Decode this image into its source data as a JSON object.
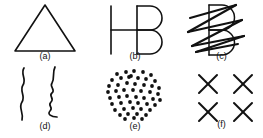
{
  "figure": {
    "background_color": "#ffffff",
    "ink_color": "#111111",
    "width": 263,
    "height": 138,
    "panel_count": 6,
    "layout": "2 rows x 3 columns"
  },
  "captions": {
    "a": "(a)",
    "b": "(b)",
    "c": "(c)",
    "d": "(d)",
    "e": "(e)",
    "f": "(f)"
  },
  "panels": [
    {
      "id": "a",
      "caption": "(a)",
      "content": "outline triangle",
      "shape": "triangle",
      "apex": [
        45,
        5
      ],
      "base_left": [
        15,
        51
      ],
      "base_right": [
        75,
        51
      ],
      "stroke_width": 1.6
    },
    {
      "id": "b",
      "caption": "(b)",
      "content": "ambiguous H / B figure",
      "shape": "letter-figure",
      "vertical_bar_x": 111,
      "vertical_bar_top": 6,
      "vertical_bar_bottom": 54,
      "crossbar_y": 30,
      "crossbar_x1": 111,
      "crossbar_x2": 137,
      "b_spine_x": 137,
      "b_top": 6,
      "b_bottom": 54,
      "b_right": 160,
      "stroke_width": 1.6
    },
    {
      "id": "c",
      "caption": "(c)",
      "content": "B figure occluded by heavy zigzag scribble",
      "shape": "letter-figure-with-scribble",
      "b_spine_x": 209,
      "b_top": 5,
      "b_bottom": 55,
      "b_right": 234,
      "scribble_strokes": 6,
      "stroke_width": 1.6,
      "scribble_width": 2.2
    },
    {
      "id": "d",
      "caption": "(d)",
      "content": "two wavy vertical contours forming a face profile illusion",
      "shape": "wavy-contours",
      "left_line_x": 22,
      "right_line_x": 53,
      "top": 70,
      "bottom": 122,
      "stroke_width": 1.7
    },
    {
      "id": "e",
      "caption": "(e)",
      "content": "cluster of filled dots",
      "shape": "dot-cluster",
      "dot_count": 52,
      "dot_radius": 1.9,
      "cluster_center": [
        134,
        94
      ],
      "cluster_radius_x": 27,
      "cluster_radius_y": 24
    },
    {
      "id": "f",
      "caption": "(f)",
      "content": "four X marks arranged in a 2 by 2 grid",
      "shape": "x-grid",
      "rows": 2,
      "columns": 2,
      "mark_count": 4,
      "centers": [
        [
          208,
          84
        ],
        [
          243,
          84
        ],
        [
          208,
          112
        ],
        [
          243,
          112
        ]
      ],
      "mark_half_size": 9,
      "stroke_width": 2.0
    }
  ],
  "dot_positions": [
    [
      117,
      74
    ],
    [
      126,
      72
    ],
    [
      134,
      71
    ],
    [
      143,
      72
    ],
    [
      151,
      75
    ],
    [
      112,
      80
    ],
    [
      121,
      78
    ],
    [
      129,
      77
    ],
    [
      138,
      78
    ],
    [
      146,
      79
    ],
    [
      155,
      81
    ],
    [
      109,
      86
    ],
    [
      118,
      85
    ],
    [
      127,
      83
    ],
    [
      135,
      84
    ],
    [
      144,
      85
    ],
    [
      152,
      86
    ],
    [
      159,
      88
    ],
    [
      108,
      92
    ],
    [
      116,
      91
    ],
    [
      124,
      90
    ],
    [
      133,
      90
    ],
    [
      141,
      91
    ],
    [
      150,
      92
    ],
    [
      158,
      94
    ],
    [
      110,
      98
    ],
    [
      119,
      97
    ],
    [
      127,
      96
    ],
    [
      136,
      97
    ],
    [
      144,
      98
    ],
    [
      153,
      99
    ],
    [
      160,
      100
    ],
    [
      112,
      104
    ],
    [
      121,
      103
    ],
    [
      130,
      102
    ],
    [
      138,
      103
    ],
    [
      147,
      104
    ],
    [
      155,
      105
    ],
    [
      115,
      110
    ],
    [
      124,
      109
    ],
    [
      133,
      108
    ],
    [
      141,
      109
    ],
    [
      150,
      110
    ],
    [
      120,
      115
    ],
    [
      128,
      114
    ],
    [
      137,
      114
    ],
    [
      146,
      115
    ],
    [
      125,
      119
    ],
    [
      134,
      118
    ],
    [
      142,
      119
    ],
    [
      131,
      76
    ]
  ]
}
